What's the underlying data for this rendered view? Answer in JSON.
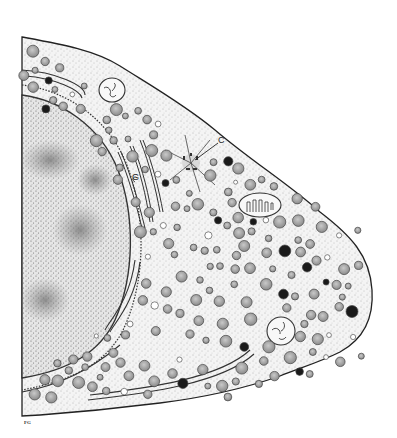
{
  "figure": {
    "labels": {
      "centriole": "C",
      "golgi": "G"
    },
    "signature": "FG"
  },
  "colors": {
    "background": "#ffffff",
    "ink": "#222222",
    "cytoplasm": "#f2f2f2",
    "nucleus": "#dcdcdc",
    "granule_light": "#a8a8a8",
    "granule_dark": "#1a1a1a"
  }
}
